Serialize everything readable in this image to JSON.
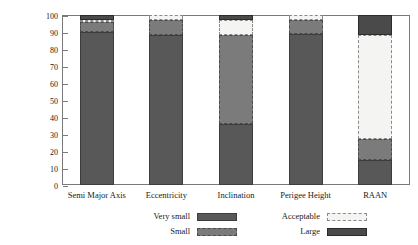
{
  "chart_data": {
    "type": "bar",
    "subtype": "stacked-bar-vertical",
    "title": "",
    "xlabel": "",
    "ylabel": "Deviating Objects [per cent]",
    "ylim": [
      0,
      100
    ],
    "yticks": [
      0,
      10,
      20,
      30,
      40,
      50,
      60,
      70,
      80,
      90,
      100
    ],
    "ytick_labels": [
      "0",
      "10",
      "20",
      "30",
      "40",
      "50",
      "60",
      "70",
      "80",
      "90",
      "100"
    ],
    "grid": false,
    "legend_position": "bottom",
    "categories": [
      "Semi Major Axis",
      "Eccentricity",
      "Inclination",
      "Perigee Height",
      "RAAN"
    ],
    "series": [
      {
        "name": "Very small",
        "color": "#585858",
        "edge": "#3d3d3d",
        "style": "solid",
        "values": [
          90,
          88,
          36,
          89,
          15
        ]
      },
      {
        "name": "Small",
        "color": "#7b7b7b",
        "edge": "#4a4a4a",
        "style": "dashed",
        "values": [
          6,
          9,
          52,
          8,
          12
        ]
      },
      {
        "name": "Acceptable",
        "color": "#f4f4f2",
        "edge": "#8a8a8a",
        "style": "dashed",
        "values": [
          1,
          3,
          9,
          3,
          61
        ]
      },
      {
        "name": "Large",
        "color": "#4a4a4a",
        "edge": "#2c2c2c",
        "style": "solid",
        "values": [
          3,
          0,
          3,
          0,
          12
        ]
      }
    ]
  },
  "legend": {
    "entries": [
      {
        "label": "Very small",
        "column": "left",
        "row": 0
      },
      {
        "label": "Small",
        "column": "left",
        "row": 1
      },
      {
        "label": "Acceptable",
        "column": "right",
        "row": 0
      },
      {
        "label": "Large",
        "column": "right",
        "row": 1
      }
    ]
  },
  "colors": {
    "very_small": "#585858",
    "small": "#7b7b7b",
    "acceptable": "#f4f4f2",
    "large": "#4a4a4a",
    "axis": "#7a7a7a",
    "text": "#1a1a1a",
    "background": "#ffffff"
  }
}
